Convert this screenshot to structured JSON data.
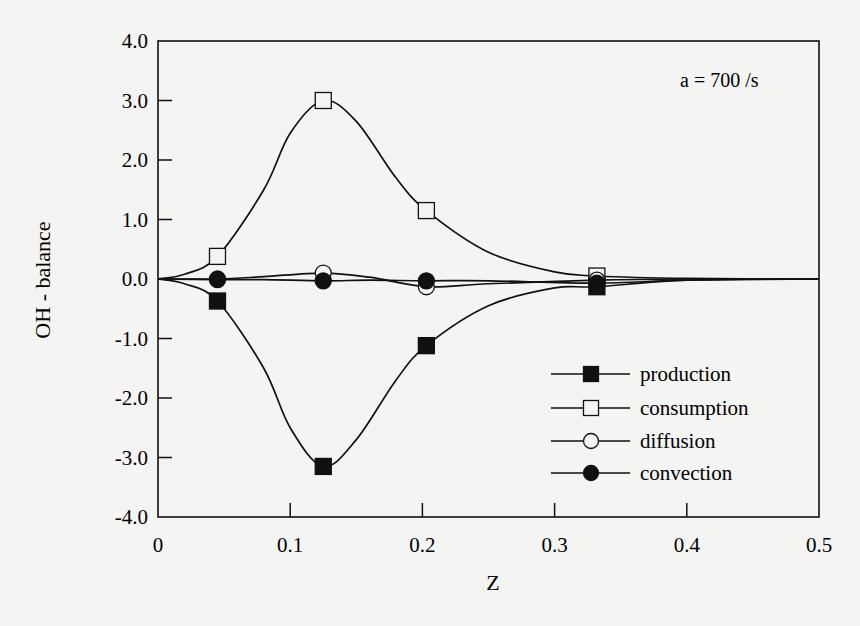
{
  "chart_data": {
    "type": "line",
    "title": "",
    "annotation": "a = 700 /s",
    "xlabel": "Z",
    "ylabel": "OH - balance",
    "xlim": [
      0,
      0.5
    ],
    "ylim": [
      -4.0,
      4.0
    ],
    "xticks": [
      "0",
      "0.1",
      "0.2",
      "0.3",
      "0.4",
      "0.5"
    ],
    "xtick_values": [
      0,
      0.1,
      0.2,
      0.3,
      0.4,
      0.5
    ],
    "yticks": [
      "4.0",
      "3.0",
      "2.0",
      "1.0",
      "0.0",
      "-1.0",
      "-2.0",
      "-3.0",
      "-4.0"
    ],
    "ytick_values": [
      4,
      3,
      2,
      1,
      0,
      -1,
      -2,
      -3,
      -4
    ],
    "grid": false,
    "legend_position": "lower right",
    "series": [
      {
        "name": "production",
        "marker": "filled-square",
        "x": [
          0,
          0.02,
          0.045,
          0.08,
          0.1,
          0.125,
          0.15,
          0.18,
          0.203,
          0.25,
          0.3,
          0.332,
          0.4,
          0.5
        ],
        "values": [
          0,
          -0.08,
          -0.37,
          -1.5,
          -2.5,
          -3.15,
          -2.7,
          -1.7,
          -1.12,
          -0.45,
          -0.15,
          -0.13,
          -0.02,
          0
        ],
        "markers_at": [
          0.045,
          0.125,
          0.203,
          0.332
        ]
      },
      {
        "name": "consumption",
        "marker": "open-square",
        "x": [
          0,
          0.02,
          0.045,
          0.08,
          0.1,
          0.125,
          0.15,
          0.18,
          0.203,
          0.25,
          0.3,
          0.332,
          0.4,
          0.5
        ],
        "values": [
          0,
          0.08,
          0.38,
          1.5,
          2.45,
          3.0,
          2.65,
          1.7,
          1.15,
          0.45,
          0.12,
          0.05,
          0.01,
          0
        ],
        "markers_at": [
          0.045,
          0.125,
          0.203,
          0.332
        ]
      },
      {
        "name": "diffusion",
        "marker": "open-circle",
        "x": [
          0,
          0.045,
          0.08,
          0.125,
          0.16,
          0.203,
          0.25,
          0.332,
          0.4,
          0.5
        ],
        "values": [
          0,
          0,
          0.04,
          0.1,
          0.03,
          -0.13,
          -0.08,
          -0.02,
          0,
          0
        ],
        "markers_at": [
          0.045,
          0.125,
          0.203,
          0.332
        ]
      },
      {
        "name": "convection",
        "marker": "filled-circle",
        "x": [
          0,
          0.045,
          0.08,
          0.125,
          0.16,
          0.203,
          0.25,
          0.332,
          0.4,
          0.5
        ],
        "values": [
          0,
          -0.01,
          -0.01,
          -0.03,
          -0.02,
          -0.03,
          -0.03,
          -0.07,
          -0.02,
          0
        ],
        "markers_at": [
          0.045,
          0.125,
          0.203,
          0.332
        ]
      }
    ]
  },
  "axes": {
    "xlabel": "Z",
    "ylabel": "OH - balance",
    "annotation": "a = 700 /s"
  },
  "legend": [
    {
      "label": "production",
      "marker": "filled-square"
    },
    {
      "label": "consumption",
      "marker": "open-square"
    },
    {
      "label": "diffusion",
      "marker": "open-circle"
    },
    {
      "label": "convection",
      "marker": "filled-circle"
    }
  ],
  "colors": {
    "ink": "#111111",
    "background": "#f4f4f2"
  }
}
